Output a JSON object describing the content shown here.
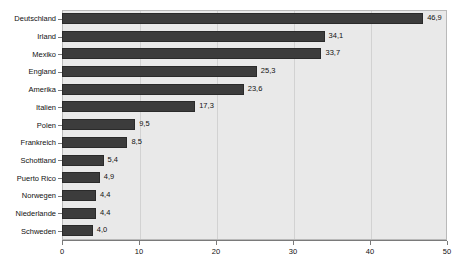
{
  "chart_data": {
    "type": "bar",
    "orientation": "horizontal",
    "title": "",
    "subtitle": "",
    "xlabel": "",
    "ylabel": "",
    "xlim": [
      0,
      50
    ],
    "xticks": [
      "0",
      "10",
      "20",
      "30",
      "40",
      "50"
    ],
    "xtick_values": [
      0,
      10,
      20,
      30,
      40,
      50
    ],
    "grid": true,
    "legend": false,
    "decimal_separator": ",",
    "categories": [
      "Deutschland",
      "Irland",
      "Mexiko",
      "England",
      "Amerika",
      "Italien",
      "Polen",
      "Frankreich",
      "Schottland",
      "Puerto Rico",
      "Norwegen",
      "Niederlande",
      "Schweden"
    ],
    "values": [
      46.9,
      34.1,
      33.7,
      25.3,
      23.6,
      17.3,
      9.5,
      8.5,
      5.4,
      4.9,
      4.4,
      4.4,
      4.0
    ],
    "labels": [
      "46,9",
      "34,1",
      "33,7",
      "25,3",
      "23,6",
      "17,3",
      "9,5",
      "8,5",
      "5,4",
      "4,9",
      "4,4",
      "4,4",
      "4,0"
    ],
    "colors": {
      "bar": "#3c3c3c",
      "bar_border": "#2a2a2a",
      "plot_background": "#e9e9e9",
      "plot_border": "#b9b9b9",
      "gridline": "#d2d2d2",
      "axis": "#7a7a7a",
      "text": "#111111",
      "page_background": "#ffffff"
    }
  }
}
